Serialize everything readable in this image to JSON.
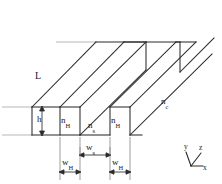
{
  "figure": {
    "type": "technical-line-drawing",
    "background_color": "#ffffff",
    "line_color": "#2b2b2b",
    "guide_color": "#8c8c8c",
    "text_color": "#1a1a1a"
  },
  "labels": {
    "length": {
      "base": "L",
      "sub": ""
    },
    "height": {
      "base": "h",
      "sub": ""
    },
    "ridge_index_left": {
      "base": "n",
      "sub": "H"
    },
    "ridge_index_right": {
      "base": "n",
      "sub": "H"
    },
    "slab_index": {
      "base": "n",
      "sub": "s"
    },
    "cladding_index": {
      "base": "n",
      "sub": "c"
    },
    "gap_width": {
      "base": "w",
      "sub": "s"
    },
    "ridge_width_left": {
      "base": "w",
      "sub": "H"
    },
    "ridge_width_right": {
      "base": "w",
      "sub": "H"
    }
  },
  "axes": {
    "x": "x",
    "y": "y",
    "z": "z"
  }
}
